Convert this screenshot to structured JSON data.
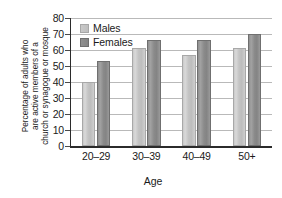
{
  "chart_data": {
    "type": "bar",
    "title": "",
    "subtitle": "",
    "xlabel": "Age",
    "ylabel": "Percentage of adults who are active members of a church or synagogue or mosque",
    "ylabel_lines": [
      "Percentage of adults who",
      "are active members of a",
      "church or synagogue or mosque"
    ],
    "categories": [
      "20–29",
      "30–39",
      "40–49",
      "50+"
    ],
    "series": [
      {
        "name": "Males",
        "values": [
          40,
          61,
          57,
          61
        ],
        "color": "#c6c6c6"
      },
      {
        "name": "Females",
        "values": [
          53,
          66,
          66,
          70
        ],
        "color": "#8c8c8c"
      }
    ],
    "ylim": [
      0,
      80
    ],
    "ytick_labels": [
      "80",
      "70",
      "60",
      "50",
      "40",
      "30",
      "20",
      "10",
      "0"
    ],
    "ytick_values": [
      80,
      70,
      60,
      50,
      40,
      30,
      20,
      10,
      0
    ],
    "ytick_step": 10,
    "grid": true,
    "grid_axis": "y",
    "legend_position": "top-left-inside",
    "legend_entries": [
      "Males",
      "Females"
    ]
  }
}
